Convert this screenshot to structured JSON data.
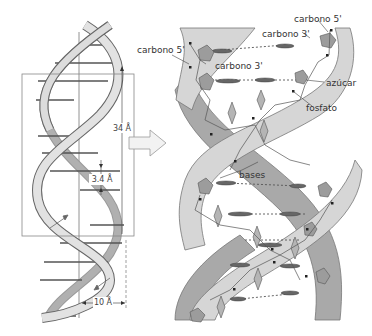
{
  "diagram": {
    "type": "dna-double-helix",
    "left_panel": {
      "labels": {
        "pitch": "34 Å",
        "base_spacing": "3.4 Å",
        "diameter": "10 Å"
      }
    },
    "right_panel": {
      "labels": {
        "carbono5_left": "carbono 5'",
        "carbono3_left": "carbono 3'",
        "carbono5_right": "carbono 5'",
        "carbono3_right": "carbono 3'",
        "azucar": "azúcar",
        "fosfato": "fosfato",
        "bases": "bases"
      }
    },
    "colors": {
      "strand_light": "#d9d9d9",
      "strand_dark": "#a8a8a8",
      "outline": "#666666",
      "sugar": "#9a9a9a",
      "base_bar": "#555555",
      "box": "#888888"
    }
  }
}
